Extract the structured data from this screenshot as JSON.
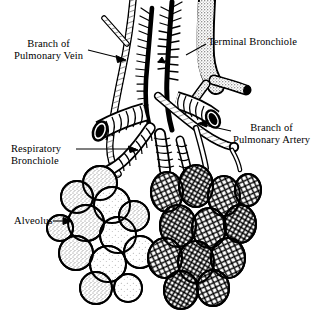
{
  "figure": {
    "style": "black-and-white pen-and-ink anatomical line engraving",
    "background_color": "#ffffff",
    "ink_color": "#000000"
  },
  "labels": {
    "pulmonary_vein": {
      "line1": "Branch of",
      "line2": "Pulmonary Vein"
    },
    "terminal_bronchiole": {
      "line1": "Terminal Bronchiole"
    },
    "pulmonary_artery": {
      "line1": "Branch of",
      "line2": "Pulmonary Artery"
    },
    "respiratory_bronchiole": {
      "line1": "Respiratory",
      "line2": "Bronchiole"
    },
    "alveolus": {
      "line1": "Alveolus"
    }
  }
}
